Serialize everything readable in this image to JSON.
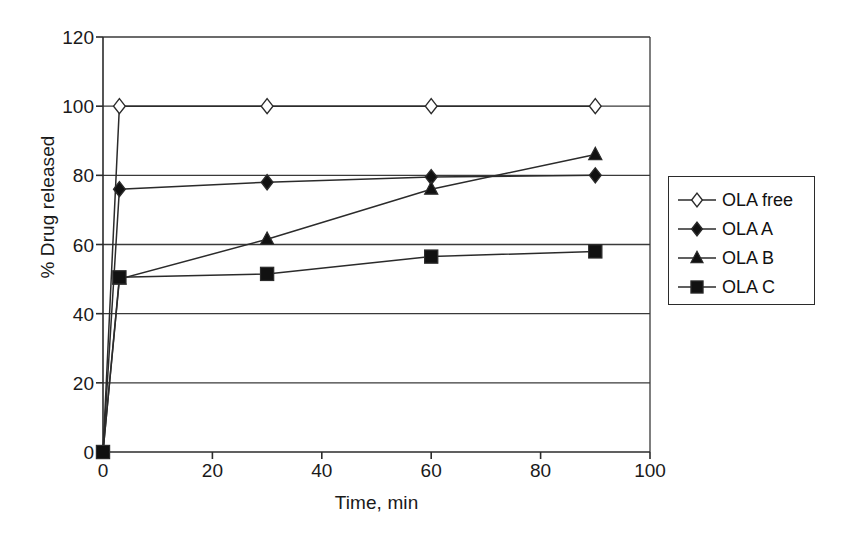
{
  "chart_data": {
    "type": "line",
    "title": "",
    "xlabel": "Time, min",
    "ylabel": "% Drug released",
    "xlim": [
      0,
      100
    ],
    "ylim": [
      0,
      120
    ],
    "xticks": [
      0,
      20,
      40,
      60,
      80,
      100
    ],
    "yticks": [
      0,
      20,
      40,
      60,
      80,
      100,
      120
    ],
    "grid": "horizontal",
    "legend_position": "right-outside",
    "x": [
      0,
      3,
      30,
      60,
      90
    ],
    "series": [
      {
        "name": "OLA free",
        "marker": "open-diamond",
        "values": [
          0,
          100,
          100,
          100,
          100
        ]
      },
      {
        "name": "OLA A",
        "marker": "filled-diamond",
        "values": [
          0,
          76,
          78,
          79.5,
          80
        ]
      },
      {
        "name": "OLA B",
        "marker": "filled-triangle",
        "values": [
          0,
          50,
          61.5,
          76,
          86
        ]
      },
      {
        "name": "OLA C",
        "marker": "filled-square",
        "values": [
          0,
          50.5,
          51.5,
          56.5,
          58
        ]
      }
    ]
  },
  "axes": {
    "y_tick_labels": [
      "120",
      "100",
      "80",
      "60",
      "40",
      "20",
      "0"
    ],
    "x_tick_labels": [
      "0",
      "20",
      "40",
      "60",
      "80",
      "100"
    ],
    "x_title": "Time, min",
    "y_title": "% Drug released"
  },
  "legend": {
    "entries": [
      {
        "label": "OLA free",
        "marker": "open-diamond"
      },
      {
        "label": "OLA A",
        "marker": "filled-diamond"
      },
      {
        "label": "OLA B",
        "marker": "filled-triangle"
      },
      {
        "label": "OLA C",
        "marker": "filled-square"
      }
    ]
  },
  "colors": {
    "line": "#2b2b2b",
    "grid": "#3a3a3a",
    "text": "#1a1a1a",
    "background": "#ffffff",
    "marker_fill": "#111111",
    "marker_open_fill": "#ffffff"
  }
}
